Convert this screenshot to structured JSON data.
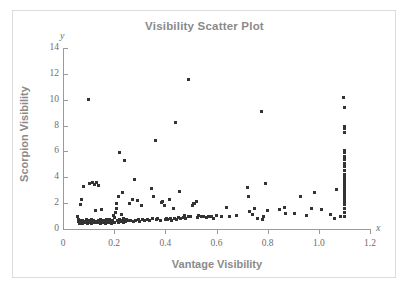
{
  "figure": {
    "title": "Visibility Scatter Plot",
    "background_color": "#ffffff",
    "frame_color": "#dcdcdc",
    "marker_color": "#333333",
    "axis_color": "#9a9a9a",
    "label_color": "#8a8a8a"
  },
  "axes": {
    "x_var_symbol": "x",
    "y_var_symbol": "y",
    "x_title": "Vantage Visibility",
    "y_title": "Scorpion Visibility",
    "x_ticks": [
      "0",
      "0.2",
      "0.4",
      "0.6",
      "0.8",
      "1.0",
      "1.2"
    ],
    "y_ticks": [
      "0",
      "2",
      "4",
      "6",
      "8",
      "10",
      "12",
      "14"
    ]
  },
  "chart_data": {
    "type": "scatter",
    "title": "Visibility Scatter Plot",
    "xlabel": "Vantage Visibility",
    "ylabel": "Scorpion Visibility",
    "xlim": [
      0,
      1.2
    ],
    "ylim": [
      0,
      14
    ],
    "xticks": [
      0,
      0.2,
      0.4,
      0.6,
      0.8,
      1.0,
      1.2
    ],
    "yticks": [
      0,
      2,
      4,
      6,
      8,
      10,
      12,
      14
    ],
    "grid": false,
    "legend": null,
    "marker": "square",
    "marker_size": 3,
    "series": [
      {
        "name": "observations",
        "color": "#333333",
        "points": [
          [
            0.055,
            0.95
          ],
          [
            0.06,
            0.72
          ],
          [
            0.062,
            0.55
          ],
          [
            0.065,
            0.45
          ],
          [
            0.068,
            0.62
          ],
          [
            0.07,
            1.9
          ],
          [
            0.072,
            2.3
          ],
          [
            0.074,
            0.5
          ],
          [
            0.076,
            0.42
          ],
          [
            0.078,
            0.68
          ],
          [
            0.08,
            0.58
          ],
          [
            0.082,
            3.25
          ],
          [
            0.085,
            0.52
          ],
          [
            0.088,
            0.48
          ],
          [
            0.09,
            0.75
          ],
          [
            0.092,
            0.6
          ],
          [
            0.095,
            0.44
          ],
          [
            0.098,
            0.55
          ],
          [
            0.1,
            10.05
          ],
          [
            0.1,
            0.65
          ],
          [
            0.102,
            0.5
          ],
          [
            0.105,
            3.5
          ],
          [
            0.108,
            0.58
          ],
          [
            0.11,
            0.46
          ],
          [
            0.112,
            0.7
          ],
          [
            0.115,
            3.6
          ],
          [
            0.118,
            0.54
          ],
          [
            0.12,
            0.62
          ],
          [
            0.122,
            3.45
          ],
          [
            0.125,
            0.48
          ],
          [
            0.128,
            1.4
          ],
          [
            0.13,
            0.56
          ],
          [
            0.132,
            3.6
          ],
          [
            0.135,
            0.5
          ],
          [
            0.138,
            0.64
          ],
          [
            0.14,
            3.35
          ],
          [
            0.142,
            0.52
          ],
          [
            0.145,
            0.72
          ],
          [
            0.148,
            0.46
          ],
          [
            0.15,
            1.5
          ],
          [
            0.152,
            0.6
          ],
          [
            0.155,
            0.54
          ],
          [
            0.158,
            0.48
          ],
          [
            0.16,
            0.66
          ],
          [
            0.162,
            0.52
          ],
          [
            0.165,
            0.58
          ],
          [
            0.168,
            0.44
          ],
          [
            0.17,
            0.7
          ],
          [
            0.172,
            0.5
          ],
          [
            0.175,
            0.62
          ],
          [
            0.178,
            0.56
          ],
          [
            0.18,
            0.48
          ],
          [
            0.182,
            0.74
          ],
          [
            0.185,
            0.52
          ],
          [
            0.188,
            0.6
          ],
          [
            0.19,
            0.45
          ],
          [
            0.192,
            0.68
          ],
          [
            0.195,
            0.55
          ],
          [
            0.198,
            1.05
          ],
          [
            0.2,
            0.5
          ],
          [
            0.202,
            0.88
          ],
          [
            0.205,
            1.3
          ],
          [
            0.208,
            1.6
          ],
          [
            0.21,
            2.0
          ],
          [
            0.212,
            0.62
          ],
          [
            0.215,
            0.54
          ],
          [
            0.218,
            2.5
          ],
          [
            0.22,
            0.7
          ],
          [
            0.222,
            5.95
          ],
          [
            0.225,
            0.58
          ],
          [
            0.228,
            1.15
          ],
          [
            0.23,
            0.66
          ],
          [
            0.232,
            2.85
          ],
          [
            0.235,
            0.5
          ],
          [
            0.238,
            0.78
          ],
          [
            0.24,
            0.6
          ],
          [
            0.242,
            5.3
          ],
          [
            0.245,
            0.55
          ],
          [
            0.25,
            0.72
          ],
          [
            0.255,
            0.62
          ],
          [
            0.26,
            1.95
          ],
          [
            0.265,
            0.68
          ],
          [
            0.27,
            2.25
          ],
          [
            0.275,
            0.58
          ],
          [
            0.28,
            3.8
          ],
          [
            0.285,
            0.65
          ],
          [
            0.29,
            2.2
          ],
          [
            0.295,
            0.7
          ],
          [
            0.3,
            0.6
          ],
          [
            0.305,
            1.85
          ],
          [
            0.31,
            0.75
          ],
          [
            0.32,
            0.68
          ],
          [
            0.33,
            0.72
          ],
          [
            0.34,
            0.65
          ],
          [
            0.345,
            3.15
          ],
          [
            0.35,
            0.8
          ],
          [
            0.355,
            2.55
          ],
          [
            0.36,
            6.85
          ],
          [
            0.365,
            0.7
          ],
          [
            0.37,
            0.78
          ],
          [
            0.38,
            0.68
          ],
          [
            0.385,
            2.05
          ],
          [
            0.39,
            2.15
          ],
          [
            0.395,
            1.85
          ],
          [
            0.4,
            0.75
          ],
          [
            0.405,
            0.82
          ],
          [
            0.41,
            0.7
          ],
          [
            0.415,
            2.3
          ],
          [
            0.42,
            0.78
          ],
          [
            0.425,
            0.68
          ],
          [
            0.43,
            1.55
          ],
          [
            0.435,
            0.85
          ],
          [
            0.44,
            8.2
          ],
          [
            0.445,
            0.75
          ],
          [
            0.45,
            0.9
          ],
          [
            0.455,
            2.9
          ],
          [
            0.46,
            0.8
          ],
          [
            0.47,
            0.88
          ],
          [
            0.475,
            1.05
          ],
          [
            0.48,
            0.78
          ],
          [
            0.49,
            11.6
          ],
          [
            0.49,
            0.95
          ],
          [
            0.5,
            1.0
          ],
          [
            0.505,
            1.85
          ],
          [
            0.51,
            2.0
          ],
          [
            0.515,
            1.95
          ],
          [
            0.52,
            2.1
          ],
          [
            0.525,
            0.9
          ],
          [
            0.53,
            1.05
          ],
          [
            0.54,
            0.95
          ],
          [
            0.55,
            1.0
          ],
          [
            0.56,
            0.88
          ],
          [
            0.57,
            1.0
          ],
          [
            0.58,
            0.95
          ],
          [
            0.59,
            0.8
          ],
          [
            0.6,
            1.05
          ],
          [
            0.62,
            0.95
          ],
          [
            0.64,
            1.65
          ],
          [
            0.65,
            1.0
          ],
          [
            0.68,
            1.05
          ],
          [
            0.72,
            3.2
          ],
          [
            0.725,
            2.55
          ],
          [
            0.73,
            1.35
          ],
          [
            0.74,
            1.1
          ],
          [
            0.75,
            1.55
          ],
          [
            0.76,
            0.85
          ],
          [
            0.775,
            9.05
          ],
          [
            0.78,
            0.72
          ],
          [
            0.785,
            1.0
          ],
          [
            0.79,
            3.5
          ],
          [
            0.8,
            1.4
          ],
          [
            0.845,
            1.5
          ],
          [
            0.865,
            1.65
          ],
          [
            0.87,
            1.2
          ],
          [
            0.905,
            1.2
          ],
          [
            0.93,
            2.55
          ],
          [
            0.95,
            1.05
          ],
          [
            0.97,
            1.55
          ],
          [
            0.985,
            2.85
          ],
          [
            1.01,
            1.5
          ],
          [
            1.045,
            1.1
          ],
          [
            1.06,
            0.85
          ],
          [
            1.07,
            3.05
          ],
          [
            1.085,
            1.0
          ],
          [
            1.095,
            10.2
          ],
          [
            1.1,
            9.4
          ],
          [
            1.1,
            7.9
          ],
          [
            1.1,
            7.75
          ],
          [
            1.1,
            7.5
          ],
          [
            1.1,
            6.1
          ],
          [
            1.1,
            5.9
          ],
          [
            1.1,
            5.6
          ],
          [
            1.1,
            5.35
          ],
          [
            1.1,
            5.1
          ],
          [
            1.1,
            4.8
          ],
          [
            1.1,
            4.5
          ],
          [
            1.1,
            4.25
          ],
          [
            1.1,
            4.0
          ],
          [
            1.1,
            3.8
          ],
          [
            1.1,
            3.6
          ],
          [
            1.1,
            3.4
          ],
          [
            1.1,
            3.25
          ],
          [
            1.1,
            3.1
          ],
          [
            1.1,
            2.95
          ],
          [
            1.1,
            2.8
          ],
          [
            1.1,
            2.6
          ],
          [
            1.1,
            2.4
          ],
          [
            1.1,
            2.2
          ],
          [
            1.1,
            2.05
          ],
          [
            1.1,
            1.9
          ],
          [
            1.1,
            1.55
          ],
          [
            1.1,
            1.25
          ],
          [
            1.1,
            1.0
          ]
        ]
      }
    ]
  }
}
